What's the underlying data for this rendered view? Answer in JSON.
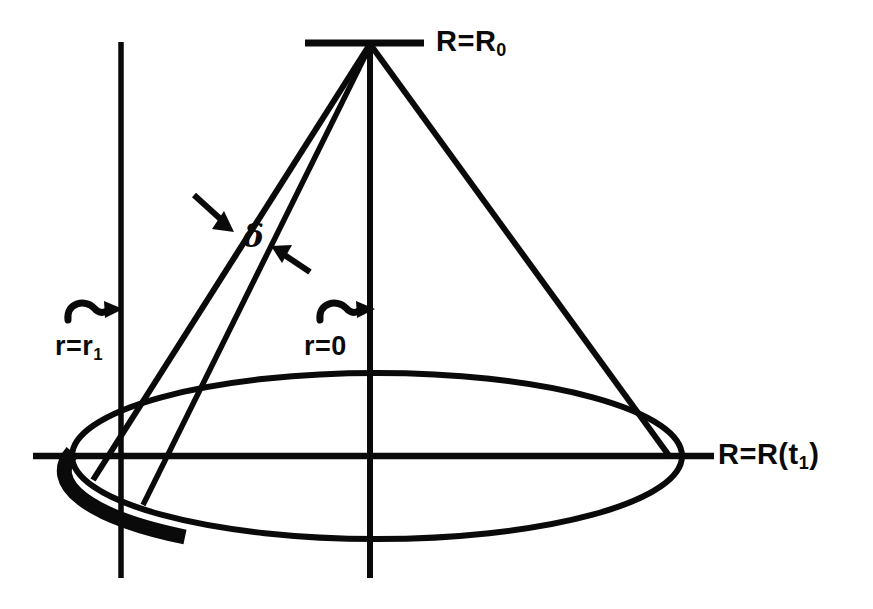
{
  "figure": {
    "background_color": "#ffffff",
    "stroke_color": "#0a0a0a",
    "labels": {
      "apex_label": {
        "base": "R=R",
        "sub": "0",
        "name": "R=R0"
      },
      "base_label": {
        "prefix": "R=R(t",
        "sub": "1",
        "suffix": ")",
        "name": "R=R(t1)"
      },
      "left_radius_label": {
        "base": "r=r",
        "sub": "1",
        "name": "r=r1"
      },
      "center_radius_label": {
        "base": "r=0",
        "sub": "",
        "name": "r=0"
      },
      "thickness_label": {
        "base": "δ",
        "name": "delta"
      }
    },
    "geometry": {
      "apex": {
        "x": 370,
        "y": 44
      },
      "apex_bar": {
        "x1": 305,
        "x2": 424,
        "y": 43
      },
      "horizontal_axis": {
        "x1": 33,
        "x2": 714,
        "y": 456
      },
      "center_vertical_axis": {
        "x": 370,
        "y1": 44,
        "y2": 578
      },
      "left_vertical_line": {
        "x": 121,
        "y1": 42,
        "y2": 578
      },
      "ellipse": {
        "cx": 377,
        "cy": 456,
        "rx": 305,
        "ry": 83
      },
      "cone_edge_left": {
        "x1": 370,
        "y1": 44,
        "x2": 93,
        "y2": 479
      },
      "cone_edge_right": {
        "x1": 370,
        "y1": 44,
        "x2": 669,
        "y2": 456
      },
      "inner_slant": {
        "x1": 370,
        "y1": 44,
        "x2": 143,
        "y2": 504
      },
      "thick_arc_start_deg": 183,
      "thick_arc_end_deg": 231,
      "delta_arrows": [
        {
          "from_x": 196,
          "from_y": 196,
          "to_x": 230,
          "to_y": 227
        },
        {
          "from_x": 303,
          "from_y": 265,
          "to_x": 269,
          "to_y": 244
        }
      ],
      "curly_arrows": [
        {
          "name": "r1-arrow",
          "x": 66,
          "y": 312,
          "to_x": 121
        },
        {
          "name": "r0-arrow",
          "x": 318,
          "y": 312,
          "to_x": 370
        }
      ]
    }
  }
}
